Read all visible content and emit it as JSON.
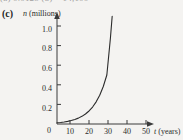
{
  "top_cropped_text": "(a)  0.0125          (b)  ≈ 14,100",
  "part_label": "(c)",
  "axes": {
    "y_axis_label_var": "n",
    "y_axis_label_unit": "(millions)",
    "x_axis_label_var": "t",
    "x_axis_label_unit": "(years)",
    "origin_label": "0"
  },
  "colors": {
    "background": "#f4f3f1",
    "axis": "#3a3a3a",
    "curve": "#2b2b2b",
    "text": "#2b2b2b"
  },
  "chart_data": {
    "type": "line",
    "title": "",
    "subtitle": "",
    "xlabel": "t (years)",
    "ylabel": "n (millions)",
    "xlim": [
      0,
      57
    ],
    "ylim": [
      0,
      1.18
    ],
    "grid": false,
    "legend": null,
    "x_ticks": [
      0,
      10,
      20,
      30,
      40,
      50
    ],
    "x_tick_labels": [
      "0",
      "10",
      "20",
      "30",
      "40",
      "50"
    ],
    "y_ticks": [
      0.2,
      0.4,
      0.6,
      0.8,
      1.0
    ],
    "y_tick_labels": [
      "0.2",
      "0.4",
      "0.6",
      "0.8",
      "1.0"
    ],
    "series": [
      {
        "name": "exponential growth",
        "description": "smooth exponential curve rising from the origin to about 1.1 million at t = 31 years",
        "x": [
          0,
          2,
          4,
          6,
          8,
          10,
          12,
          14,
          16,
          18,
          20,
          22,
          24,
          26,
          28,
          30,
          31
        ],
        "values": [
          0.012,
          0.016,
          0.021,
          0.027,
          0.035,
          0.046,
          0.06,
          0.078,
          0.102,
          0.133,
          0.173,
          0.226,
          0.294,
          0.383,
          0.5,
          0.875,
          1.1
        ]
      }
    ]
  }
}
